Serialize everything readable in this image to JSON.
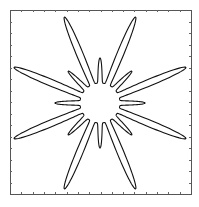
{
  "chart_data": {
    "type": "line",
    "subtype": "polar-curve-on-cartesian-axes",
    "title": "",
    "xlabel": "",
    "ylabel": "",
    "grid": false,
    "legend": null,
    "curve": {
      "center_px": [
        100,
        103
      ],
      "inner_radius_px": 20,
      "long_petals": {
        "count": 8,
        "angles_deg": [
          22.5,
          67.5,
          112.5,
          157.5,
          202.5,
          247.5,
          292.5,
          337.5
        ],
        "tip_radius_px": 93
      },
      "short_petals": {
        "count": 8,
        "angles_deg": [
          0,
          45,
          90,
          135,
          180,
          225,
          270,
          315
        ],
        "tip_radius_px": 45
      },
      "sharpness_power": 6,
      "samples": 1440
    },
    "axes": {
      "frame_px": {
        "left": 10,
        "top": 10,
        "right": 191,
        "bottom": 194
      },
      "tick_count_x": 16,
      "tick_count_y": 16,
      "tick_length_px": 2,
      "tick_direction": "in",
      "tick_labels": []
    },
    "colors": {
      "curve": "#111111",
      "frame": "#555555",
      "ticks": "#666666",
      "background": "#ffffff"
    }
  }
}
